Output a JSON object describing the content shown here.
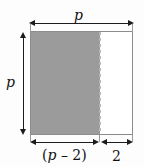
{
  "figure": {
    "colors": {
      "shaded_fill": "#9b9b9b",
      "unshaded_fill": "#ffffff",
      "outline": "#8c8c8c",
      "dashed_divider": "#b9b9b9",
      "arrow": "#1c1c1c",
      "background": "#fdfdfd"
    }
  },
  "labels": {
    "top_width": "p",
    "left_height": "p",
    "bottom_shaded_open_paren": "(",
    "bottom_shaded_variable": "p",
    "bottom_shaded_minus": " – ",
    "bottom_shaded_number": "2",
    "bottom_shaded_close_paren": ")",
    "bottom_unshaded": "2"
  },
  "dimensions": {
    "top_span": "p",
    "left_span": "p",
    "bottom_left_span": "(p – 2)",
    "bottom_right_span": "2"
  }
}
